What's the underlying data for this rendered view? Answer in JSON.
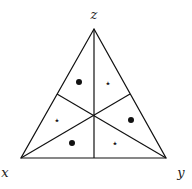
{
  "diagram": {
    "vertices": {
      "top": {
        "label": "z",
        "x": 94,
        "y": 29
      },
      "left": {
        "label": "x",
        "x": 21,
        "y": 158
      },
      "right": {
        "label": "y",
        "x": 166,
        "y": 158
      }
    },
    "center": {
      "x": 94,
      "y": 115
    },
    "markers": [
      {
        "type": "dot",
        "x": 79,
        "y": 82
      },
      {
        "type": "star",
        "x": 108,
        "y": 83
      },
      {
        "type": "star",
        "x": 57,
        "y": 120
      },
      {
        "type": "dot",
        "x": 131,
        "y": 120
      },
      {
        "type": "dot",
        "x": 72,
        "y": 143
      },
      {
        "type": "star",
        "x": 115,
        "y": 143
      }
    ],
    "star_glyph": "⋆"
  }
}
